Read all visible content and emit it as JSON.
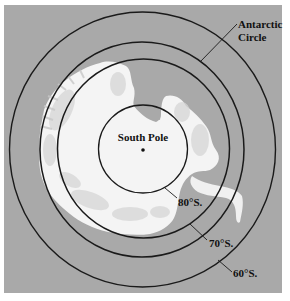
{
  "map": {
    "title": "Antarctica polar projection",
    "colors": {
      "sea": "#a9a9a9",
      "land": "#f7f7f7",
      "land_shade": "#d4d4d4",
      "line": "#1a1a1a",
      "page": "#ffffff"
    },
    "center_label": "South Pole",
    "circles": [
      {
        "name": "80°S.",
        "label": "80°S."
      },
      {
        "name": "70°S.",
        "label": "70°S."
      },
      {
        "name": "Antarctic Circle",
        "label_line1": "Antarctic",
        "label_line2": "Circle"
      },
      {
        "name": "60°S.",
        "label": "60°S."
      }
    ]
  }
}
